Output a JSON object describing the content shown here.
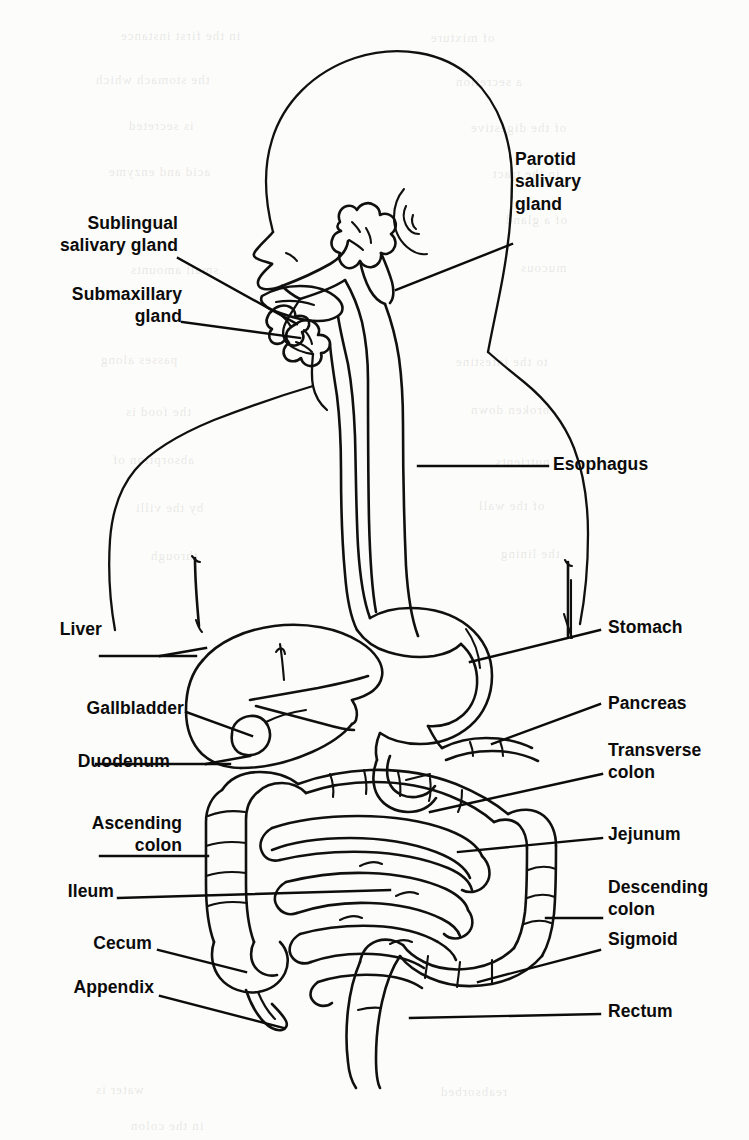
{
  "page": {
    "media": "scanned-book-figure",
    "background_color": "#fcfcfa",
    "ink_color": "#111010"
  },
  "figure": {
    "type": "anatomical-line-diagram",
    "label_count": 17
  },
  "labels": [
    {
      "id": "parotid",
      "text": "Parotid\nsalivary\ngland",
      "side": "right",
      "x": 515,
      "y": 148
    },
    {
      "id": "sublingual",
      "text": "Sublingual\nsalivary gland",
      "side": "left",
      "x": 42,
      "y": 212
    },
    {
      "id": "submaxillary",
      "text": "Submaxillary\ngland",
      "side": "left",
      "x": 42,
      "y": 283
    },
    {
      "id": "esophagus",
      "text": "Esophagus",
      "side": "right",
      "x": 553,
      "y": 453
    },
    {
      "id": "liver",
      "text": "Liver",
      "side": "left",
      "x": 102,
      "y": 618
    },
    {
      "id": "stomach",
      "text": "Stomach",
      "side": "right",
      "x": 608,
      "y": 616
    },
    {
      "id": "gallbladder",
      "text": "Gallbladder",
      "side": "left",
      "x": 57,
      "y": 697
    },
    {
      "id": "pancreas",
      "text": "Pancreas",
      "side": "right",
      "x": 608,
      "y": 692
    },
    {
      "id": "duodenum",
      "text": "Duodenum",
      "side": "left",
      "x": 63,
      "y": 750
    },
    {
      "id": "transverse-colon",
      "text": "Transverse\ncolon",
      "side": "right",
      "x": 608,
      "y": 739
    },
    {
      "id": "ascending-colon",
      "text": "Ascending\ncolon",
      "side": "left",
      "x": 75,
      "y": 812
    },
    {
      "id": "jejunum",
      "text": "Jejunum",
      "side": "right",
      "x": 608,
      "y": 823
    },
    {
      "id": "ileum",
      "text": "Ileum",
      "side": "left",
      "x": 112,
      "y": 880
    },
    {
      "id": "descending-colon",
      "text": "Descending\ncolon",
      "side": "right",
      "x": 608,
      "y": 876
    },
    {
      "id": "cecum",
      "text": "Cecum",
      "side": "left",
      "x": 110,
      "y": 932
    },
    {
      "id": "sigmoid",
      "text": "Sigmoid",
      "side": "right",
      "x": 608,
      "y": 928
    },
    {
      "id": "appendix",
      "text": "Appendix",
      "side": "left",
      "x": 92,
      "y": 976
    },
    {
      "id": "rectum",
      "text": "Rectum",
      "side": "right",
      "x": 608,
      "y": 1000
    }
  ],
  "organs": [
    "head-and-neck-outline",
    "nose-and-lip-profile",
    "ear",
    "tongue",
    "parotid-salivary-gland",
    "sublingual-salivary-gland",
    "submaxillary-gland",
    "pharynx",
    "esophagus",
    "stomach",
    "liver",
    "gallbladder",
    "pancreas",
    "duodenum",
    "jejunum",
    "ileum",
    "cecum",
    "appendix",
    "ascending-colon",
    "transverse-colon",
    "descending-colon",
    "sigmoid-colon",
    "rectum",
    "torso-outline"
  ],
  "ghost_text": [
    {
      "t": "in the first instance",
      "x": 120,
      "y": 28
    },
    {
      "t": "of mixture",
      "x": 430,
      "y": 30
    },
    {
      "t": "the stomach which",
      "x": 95,
      "y": 72
    },
    {
      "t": "a secretion",
      "x": 455,
      "y": 74
    },
    {
      "t": "is secreted",
      "x": 128,
      "y": 118
    },
    {
      "t": "of the digestive",
      "x": 470,
      "y": 120
    },
    {
      "t": "acid and enzyme",
      "x": 108,
      "y": 164
    },
    {
      "t": "in the tract",
      "x": 492,
      "y": 166
    },
    {
      "t": "the wall",
      "x": 118,
      "y": 214
    },
    {
      "t": "of a gland",
      "x": 505,
      "y": 212
    },
    {
      "t": "small amounts",
      "x": 130,
      "y": 262
    },
    {
      "t": "mucous",
      "x": 520,
      "y": 260
    },
    {
      "t": "passes along",
      "x": 100,
      "y": 352
    },
    {
      "t": "to the intestine",
      "x": 455,
      "y": 354
    },
    {
      "t": "the food is",
      "x": 125,
      "y": 404
    },
    {
      "t": "broken down",
      "x": 470,
      "y": 402
    },
    {
      "t": "absorption of",
      "x": 112,
      "y": 452
    },
    {
      "t": "nutrients",
      "x": 495,
      "y": 454
    },
    {
      "t": "by the villi",
      "x": 135,
      "y": 500
    },
    {
      "t": "of the wall",
      "x": 478,
      "y": 498
    },
    {
      "t": "through",
      "x": 150,
      "y": 548
    },
    {
      "t": "the lining",
      "x": 500,
      "y": 546
    },
    {
      "t": "water is",
      "x": 95,
      "y": 1082
    },
    {
      "t": "reabsorbed",
      "x": 440,
      "y": 1084
    },
    {
      "t": "in the colon",
      "x": 130,
      "y": 1118
    }
  ]
}
